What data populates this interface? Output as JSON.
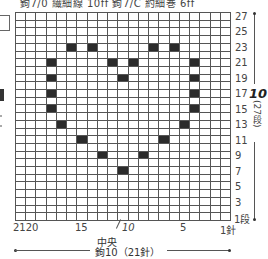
{
  "header": {
    "cropped_text": "鉤7/0 繊細線 10ff  鉤7/C 約細巻 6ff"
  },
  "chart": {
    "columns": 21,
    "rows": 27,
    "row_labels": [
      "27",
      "25",
      "23",
      "21",
      "19",
      "17",
      "15",
      "13",
      "11",
      "9",
      "7",
      "5",
      "3"
    ],
    "row_label_first": "1段",
    "rows_total_number": "10",
    "rows_total_paren": "(27段)",
    "col_labels": {
      "c21_20": "2120",
      "c15": "15",
      "c10": "10",
      "c5": "5",
      "c1": "1針"
    },
    "center_label": "中央",
    "width_label": "鉤10（21針）",
    "filled_color": "#2b2b2b",
    "filled_cells": [
      {
        "row": 23,
        "stitch": 16
      },
      {
        "row": 23,
        "stitch": 14
      },
      {
        "row": 23,
        "stitch": 8
      },
      {
        "row": 23,
        "stitch": 6
      },
      {
        "row": 21,
        "stitch": 18
      },
      {
        "row": 21,
        "stitch": 12
      },
      {
        "row": 21,
        "stitch": 10
      },
      {
        "row": 21,
        "stitch": 4
      },
      {
        "row": 19,
        "stitch": 18
      },
      {
        "row": 19,
        "stitch": 11
      },
      {
        "row": 19,
        "stitch": 4
      },
      {
        "row": 17,
        "stitch": 18
      },
      {
        "row": 17,
        "stitch": 4
      },
      {
        "row": 15,
        "stitch": 18
      },
      {
        "row": 15,
        "stitch": 4
      },
      {
        "row": 13,
        "stitch": 17
      },
      {
        "row": 13,
        "stitch": 5
      },
      {
        "row": 11,
        "stitch": 15
      },
      {
        "row": 11,
        "stitch": 7
      },
      {
        "row": 9,
        "stitch": 13
      },
      {
        "row": 9,
        "stitch": 9
      },
      {
        "row": 7,
        "stitch": 11
      }
    ]
  }
}
